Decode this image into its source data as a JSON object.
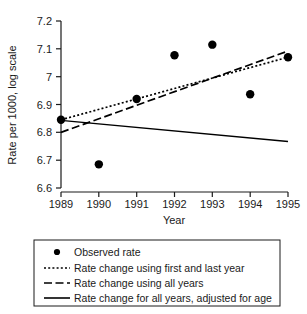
{
  "chart_data": {
    "type": "scatter",
    "title": "",
    "xlabel": "Year",
    "ylabel": "Rate per 1000, log scale",
    "x": [
      1989,
      1990,
      1991,
      1992,
      1993,
      1994,
      1995
    ],
    "xlim": [
      1989,
      1995
    ],
    "ylim": [
      6.6,
      7.2
    ],
    "xticks": [
      "1989",
      "1990",
      "1991",
      "1992",
      "1993",
      "1994",
      "1995"
    ],
    "yticks": [
      "6.6",
      "6.7",
      "6.8",
      "6.9",
      "7",
      "7.1",
      "7.2"
    ],
    "grid": false,
    "legend_position": "below-plot",
    "series": [
      {
        "name": "Observed rate",
        "type": "scatter",
        "marker": "filled-circle",
        "color": "#000000",
        "values": [
          6.845,
          6.685,
          6.92,
          7.077,
          7.115,
          6.937,
          7.07
        ]
      },
      {
        "name": "Rate change using first and last year",
        "type": "line",
        "style": "dotted",
        "color": "#000000",
        "x": [
          1989,
          1995
        ],
        "values": [
          6.845,
          7.07
        ]
      },
      {
        "name": "Rate change using all years",
        "type": "line",
        "style": "dashed",
        "color": "#000000",
        "x": [
          1989,
          1995
        ],
        "values": [
          6.8,
          7.092
        ]
      },
      {
        "name": "Rate change for all years, adjusted for age",
        "type": "line",
        "style": "solid",
        "color": "#000000",
        "x": [
          1989,
          1995
        ],
        "values": [
          6.843,
          6.767
        ]
      }
    ]
  },
  "axes": {
    "y_title": "Rate per 1000, log scale",
    "x_title": "Year",
    "y_labels": [
      "7.2",
      "7.1",
      "7",
      "6.9",
      "6.8",
      "6.7",
      "6.6"
    ],
    "x_labels": [
      "1989",
      "1990",
      "1991",
      "1992",
      "1993",
      "1994",
      "1995"
    ]
  },
  "legend": {
    "items": [
      {
        "label": "Observed rate",
        "symbol": "filled-circle"
      },
      {
        "label": "Rate change using first and last year",
        "symbol": "dotted-line"
      },
      {
        "label": "Rate change using all years",
        "symbol": "dashed-line"
      },
      {
        "label": "Rate change for all years, adjusted for age",
        "symbol": "solid-line"
      }
    ]
  }
}
